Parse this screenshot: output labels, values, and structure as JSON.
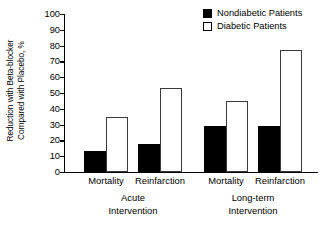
{
  "chart_data": {
    "type": "bar",
    "title": "",
    "xlabel": "",
    "ylabel": "Reduction with Beta-blocker Compared with Placebo, %",
    "ylabel_lines": [
      "Reduction with Beta-blocker",
      "Compared with Placebo, %"
    ],
    "ylim": [
      0,
      100
    ],
    "ytick_step": 10,
    "yticks": [
      100,
      90,
      80,
      70,
      60,
      50,
      40,
      30,
      20,
      10,
      0
    ],
    "grid": false,
    "legend_position": "top-right",
    "categories": [
      "Mortality",
      "Reinfarction",
      "Mortality",
      "Reinfarction"
    ],
    "groups": [
      {
        "label_lines": [
          "Acute",
          "Intervention"
        ],
        "categories": [
          "Mortality",
          "Reinfarction"
        ]
      },
      {
        "label_lines": [
          "Long-term",
          "Intervention"
        ],
        "categories": [
          "Mortality",
          "Reinfarction"
        ]
      }
    ],
    "series": [
      {
        "name": "Nondiabetic Patients",
        "style": "solid",
        "color": "#000000",
        "values": [
          13,
          18,
          29,
          29
        ]
      },
      {
        "name": "Diabetic Patients",
        "style": "hollow",
        "color": "#ffffff",
        "values": [
          35,
          53,
          45,
          77
        ]
      }
    ]
  },
  "legend": {
    "items": [
      {
        "label": "Nondiabetic Patients",
        "style": "solid"
      },
      {
        "label": "Diabetic Patients",
        "style": "hollow"
      }
    ]
  }
}
